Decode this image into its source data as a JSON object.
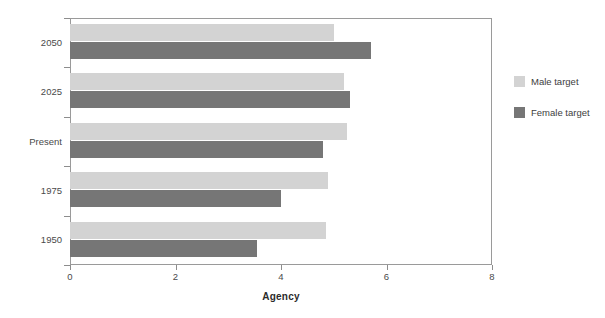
{
  "chart_data": {
    "type": "bar",
    "orientation": "horizontal",
    "title": "",
    "xlabel": "Agency",
    "ylabel": "",
    "xlim": [
      0,
      8
    ],
    "xticks": [
      "0",
      "2",
      "4",
      "6",
      "8"
    ],
    "grid": false,
    "legend_position": "right",
    "categories": [
      "1950",
      "1975",
      "Present",
      "2025",
      "2050"
    ],
    "series": [
      {
        "name": "Male target",
        "color": "#d3d3d3",
        "values": [
          4.85,
          4.9,
          5.25,
          5.2,
          5.0
        ]
      },
      {
        "name": "Female target",
        "color": "#767676",
        "values": [
          3.55,
          4.0,
          4.8,
          5.3,
          5.7
        ]
      }
    ]
  },
  "legend": {
    "items": [
      {
        "label": "Male target"
      },
      {
        "label": "Female target"
      }
    ]
  },
  "axis": {
    "x_title": "Agency"
  }
}
